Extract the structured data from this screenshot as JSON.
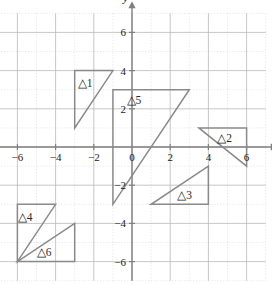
{
  "figure": {
    "title": "",
    "type": "coordinate-plane-triangles"
  },
  "chart_data": {
    "type": "scatter",
    "title": "",
    "xlabel": "x",
    "ylabel": "y",
    "xlim": [
      -7,
      7
    ],
    "ylim": [
      -7,
      7
    ],
    "grid": true,
    "grid_minor_step": 1,
    "grid_major_step": 2,
    "legend": "none",
    "xticks": [
      -6,
      -4,
      -2,
      0,
      2,
      4,
      6
    ],
    "xtick_labels": [
      "−6",
      "−4",
      "−2",
      "0",
      "2",
      "4",
      "6"
    ],
    "yticks": [
      6,
      4,
      2,
      -2,
      -4,
      -6
    ],
    "ytick_labels": [
      "6",
      "4",
      "2",
      "−2",
      "−4",
      "−6"
    ],
    "origin_label": "0",
    "axis_labels": {
      "x": "x",
      "y": "y"
    },
    "shapes": [
      {
        "name": "△1",
        "label": "△1",
        "label_xy": [
          -2.45,
          3.35
        ],
        "vertices": [
          [
            -3,
            1
          ],
          [
            -3,
            4
          ],
          [
            -1,
            4
          ]
        ],
        "closed": true
      },
      {
        "name": "△2",
        "label": "△2",
        "label_xy": [
          4.85,
          0.45
        ],
        "vertices": [
          [
            3.5,
            1
          ],
          [
            6,
            1
          ],
          [
            6,
            -1
          ]
        ],
        "closed": true
      },
      {
        "name": "△3",
        "label": "△3",
        "label_xy": [
          2.75,
          -2.5
        ],
        "vertices": [
          [
            1,
            -3
          ],
          [
            4,
            -3
          ],
          [
            4,
            -1
          ]
        ],
        "closed": true
      },
      {
        "name": "△4",
        "label": "△4",
        "label_xy": [
          -5.6,
          -3.65
        ],
        "vertices": [
          [
            -6,
            -6
          ],
          [
            -6,
            -3
          ],
          [
            -4,
            -3
          ]
        ],
        "closed": true
      },
      {
        "name": "△5",
        "label": "△5",
        "label_xy": [
          0.1,
          2.45
        ],
        "vertices": [
          [
            -1,
            -3
          ],
          [
            -1,
            3
          ],
          [
            3,
            3
          ]
        ],
        "closed": true
      },
      {
        "name": "△6",
        "label": "△6",
        "label_xy": [
          -4.6,
          -5.5
        ],
        "vertices": [
          [
            -6,
            -6
          ],
          [
            -3,
            -4
          ],
          [
            -3,
            -6
          ]
        ],
        "closed": true
      }
    ]
  }
}
